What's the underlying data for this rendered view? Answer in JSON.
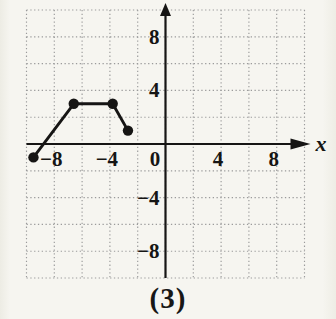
{
  "figure": {
    "caption": "(3)"
  },
  "chart_data": {
    "type": "line",
    "title": "",
    "xlabel": "x",
    "ylabel": "",
    "xlim": [
      -10,
      10
    ],
    "ylim": [
      -10,
      10
    ],
    "grid": {
      "show": true,
      "style": "dotted",
      "spacing": 2
    },
    "axes_through_origin": true,
    "x_ticks": [
      {
        "value": -8,
        "label": "−8"
      },
      {
        "value": -4,
        "label": "−4"
      },
      {
        "value": 0,
        "label": "0"
      },
      {
        "value": 4,
        "label": "4"
      },
      {
        "value": 8,
        "label": "8"
      }
    ],
    "y_ticks": [
      {
        "value": 8,
        "label": "8"
      },
      {
        "value": 4,
        "label": "4"
      },
      {
        "value": -4,
        "label": "−4"
      },
      {
        "value": -8,
        "label": "−8"
      }
    ],
    "series": [
      {
        "name": "piecewise-linear-curve",
        "marker": "filled-circle",
        "points": [
          [
            -9.5,
            -1
          ],
          [
            -6.6,
            3
          ],
          [
            -3.8,
            3
          ],
          [
            -2.7,
            1
          ]
        ]
      }
    ]
  },
  "colors": {
    "background": "#f6f5f0",
    "ink": "#161514",
    "grid": "#9b9b9b"
  }
}
